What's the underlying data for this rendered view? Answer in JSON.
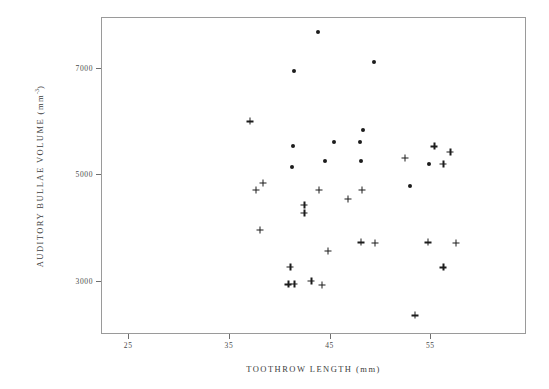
{
  "figure": {
    "background_color": "#ffffff",
    "frame_color": "#9a9a9a",
    "marker_color": "#1c1c1c"
  },
  "chart_data": {
    "type": "scatter",
    "title": "",
    "xlabel": "TOOTHROW LENGTH (mm)",
    "ylabel": "AUDITORY BULLAE VOLUME (mm",
    "ylabel_exponent": "-3",
    "ylabel_suffix": ")",
    "xlim": [
      22.3,
      64.5
    ],
    "ylim": [
      2000,
      7950
    ],
    "xticks": [
      25,
      35,
      45,
      55
    ],
    "xticklabels": [
      "25",
      "35",
      "45",
      "55"
    ],
    "yticks": [
      3000,
      5000,
      7000
    ],
    "yticklabels": [
      "3000",
      "5000",
      "7000"
    ],
    "grid": false,
    "legend": "none",
    "series": [
      {
        "name": "filled-circle",
        "marker": "circle",
        "points": [
          {
            "x": 43.8,
            "y": 7660
          },
          {
            "x": 41.5,
            "y": 6940
          },
          {
            "x": 49.4,
            "y": 7110
          },
          {
            "x": 41.4,
            "y": 5520
          },
          {
            "x": 41.3,
            "y": 5140
          },
          {
            "x": 44.5,
            "y": 5250
          },
          {
            "x": 45.4,
            "y": 5600
          },
          {
            "x": 48.0,
            "y": 5600
          },
          {
            "x": 48.3,
            "y": 5830
          },
          {
            "x": 48.1,
            "y": 5250
          },
          {
            "x": 53.0,
            "y": 4770
          },
          {
            "x": 54.9,
            "y": 5200
          }
        ]
      },
      {
        "name": "plus",
        "marker": "plus",
        "points": [
          {
            "x": 37.1,
            "y": 5990
          },
          {
            "x": 37.7,
            "y": 4710
          },
          {
            "x": 38.4,
            "y": 4830
          },
          {
            "x": 38.1,
            "y": 3950
          },
          {
            "x": 42.5,
            "y": 4430
          },
          {
            "x": 42.5,
            "y": 4280
          },
          {
            "x": 43.9,
            "y": 4710
          },
          {
            "x": 46.8,
            "y": 4530
          },
          {
            "x": 48.2,
            "y": 4710
          },
          {
            "x": 52.5,
            "y": 5310
          },
          {
            "x": 55.4,
            "y": 5520
          },
          {
            "x": 56.3,
            "y": 5200
          },
          {
            "x": 57.0,
            "y": 5420
          },
          {
            "x": 41.1,
            "y": 3260
          },
          {
            "x": 40.9,
            "y": 2930
          },
          {
            "x": 41.5,
            "y": 2940
          },
          {
            "x": 43.2,
            "y": 2990
          },
          {
            "x": 44.2,
            "y": 2920
          },
          {
            "x": 44.8,
            "y": 3560
          },
          {
            "x": 48.1,
            "y": 3720
          },
          {
            "x": 49.5,
            "y": 3710
          },
          {
            "x": 54.8,
            "y": 3720
          },
          {
            "x": 57.5,
            "y": 3710
          },
          {
            "x": 56.3,
            "y": 3250
          },
          {
            "x": 53.5,
            "y": 2350
          }
        ]
      }
    ]
  }
}
